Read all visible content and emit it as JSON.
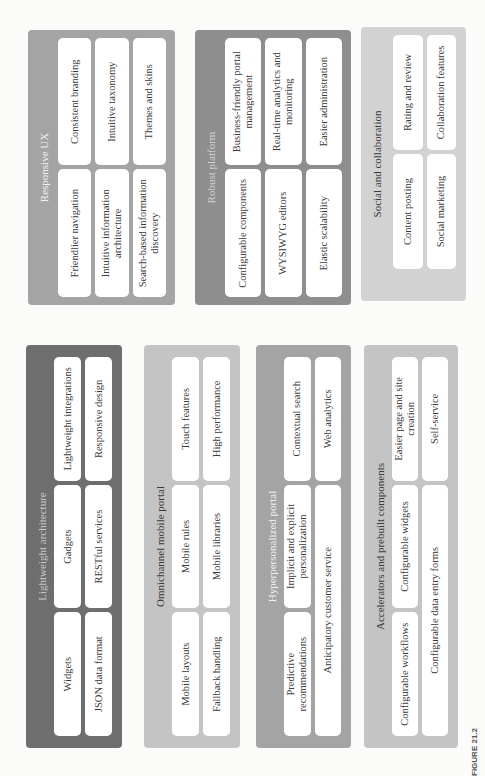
{
  "figure_caption": "FIGURE 21.2",
  "panels": {
    "responsive_ux": {
      "title": "Responsive UX",
      "items": [
        "Friendlier navigation",
        "Consistent branding",
        "Intuitive information architecture",
        "Intuitive taxonomy",
        "Search-based information discovery",
        "Themes and skins"
      ]
    },
    "robust_platform": {
      "title": "Robust platform",
      "items": [
        "Configurable components",
        "Business-friendly portal management",
        "WYSIWYG editors",
        "Real-time analytics and monitoring",
        "Elastic scalability",
        "Easier administration"
      ]
    },
    "social_collaboration": {
      "title": "Social and collaboration",
      "items": [
        "Content posting",
        "Rating and review",
        "Social marketing",
        "Collaboration features"
      ]
    },
    "lightweight_architecture": {
      "title": "Lightweight architecture",
      "items": [
        "Widgets",
        "Gadgets",
        "Lightweight integrations",
        "JSON data format",
        "RESTful services",
        "Responsive design"
      ]
    },
    "omnichannel_mobile": {
      "title": "Omnichannel mobile portal",
      "items": [
        "Mobile layouts",
        "Mobile rules",
        "Touch features",
        "Fallback handling",
        "Mobile libraries",
        "High performance"
      ]
    },
    "hyperpersonalized": {
      "title": "Hyperpersonalized portal",
      "items": [
        "Predictive recommendations",
        "Implicit and explicit personalization",
        "Contextual search",
        "Anticipatory customer service",
        "Web analytics"
      ]
    },
    "accelerators": {
      "title": "Accelerators and prebuilt components",
      "items": [
        "Configurable workflows",
        "Configurable widgets",
        "Easier page and site creation",
        "Configurable data entry forms",
        "Self-service"
      ]
    }
  },
  "colors": {
    "dark": "#6e6e6e",
    "mid": "#8e8e8e",
    "midlight": "#a4a4a4",
    "light": "#c4c4c4",
    "lighter": "#d2d2d2",
    "cell": "#ffffff"
  }
}
